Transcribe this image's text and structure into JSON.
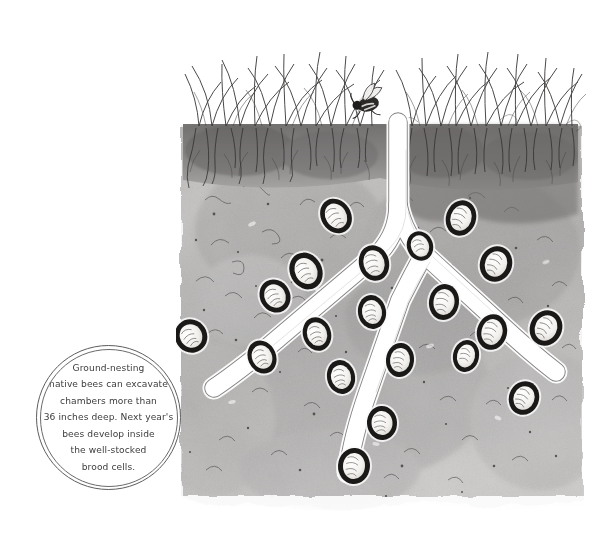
{
  "figure": {
    "caption": {
      "text": "Ground-nesting\nnative bees can excavate\nchambers more than\n36 inches deep. Next year's\nbees develop inside\nthe well-stocked\nbrood cells.",
      "lines": [
        "Ground-nesting",
        "native bees can excavate",
        "chambers more than",
        "36 inches deep. Next year's",
        "bees develop inside",
        "the well-stocked",
        "brood cells."
      ],
      "shape": "double-ring-circle",
      "text_color": "#3c3c3c",
      "ring_color": "#5d5d5d"
    },
    "style": {
      "medium": "pen-and-ink watercolor wash",
      "palette": {
        "background": "#ffffff",
        "soil_light": "#c9c7c6",
        "soil_mid": "#aeacab",
        "soil_dark": "#8d8b8a",
        "topsoil": "#7e7c7b",
        "ink": "#2b2b2b",
        "tunnel_fill": "#ffffff",
        "larva_fill": "#f7f6f4"
      }
    },
    "scene": {
      "soil_surface_y": 125,
      "soil_left": 181,
      "soil_right": 582,
      "soil_bottom": 510,
      "grass_patches": [
        {
          "name": "left-grass-patch",
          "x_start": 183,
          "x_end": 372,
          "blade_count": 26
        },
        {
          "name": "right-grass-patch",
          "x_start": 404,
          "x_end": 578,
          "blade_count": 24
        }
      ],
      "bee": {
        "name": "adult-bee",
        "x": 368,
        "y": 104,
        "note": "adult bee at nest entrance on soil surface"
      },
      "tunnels": [
        {
          "name": "main-shaft",
          "description": "vertical entrance shaft descending from surface"
        },
        {
          "name": "left-branch",
          "description": "branch running down-left toward lower left"
        },
        {
          "name": "right-branch",
          "description": "branch running down-right toward lower right"
        },
        {
          "name": "center-branch",
          "description": "branch descending to bottom center"
        }
      ],
      "brood_cell_count": 20,
      "brood_cells": [
        {
          "x": 336,
          "y": 216,
          "rx": 15,
          "ry": 18,
          "rot": -32
        },
        {
          "x": 461,
          "y": 218,
          "rx": 15,
          "ry": 18,
          "rot": 18
        },
        {
          "x": 306,
          "y": 271,
          "rx": 16,
          "ry": 19,
          "rot": -28
        },
        {
          "x": 374,
          "y": 263,
          "rx": 15,
          "ry": 18,
          "rot": -16
        },
        {
          "x": 496,
          "y": 264,
          "rx": 16,
          "ry": 18,
          "rot": 22
        },
        {
          "x": 275,
          "y": 296,
          "rx": 15,
          "ry": 17,
          "rot": -30
        },
        {
          "x": 372,
          "y": 312,
          "rx": 14,
          "ry": 17,
          "rot": -10
        },
        {
          "x": 444,
          "y": 302,
          "rx": 15,
          "ry": 18,
          "rot": 8
        },
        {
          "x": 546,
          "y": 328,
          "rx": 16,
          "ry": 18,
          "rot": 26
        },
        {
          "x": 191,
          "y": 336,
          "rx": 16,
          "ry": 17,
          "rot": -34
        },
        {
          "x": 317,
          "y": 334,
          "rx": 14,
          "ry": 17,
          "rot": -18
        },
        {
          "x": 492,
          "y": 332,
          "rx": 15,
          "ry": 18,
          "rot": 14
        },
        {
          "x": 262,
          "y": 357,
          "rx": 14,
          "ry": 17,
          "rot": -24
        },
        {
          "x": 400,
          "y": 360,
          "rx": 14,
          "ry": 17,
          "rot": 6
        },
        {
          "x": 341,
          "y": 377,
          "rx": 14,
          "ry": 17,
          "rot": -12
        },
        {
          "x": 524,
          "y": 398,
          "rx": 15,
          "ry": 17,
          "rot": 20
        },
        {
          "x": 382,
          "y": 423,
          "rx": 15,
          "ry": 17,
          "rot": -4
        },
        {
          "x": 354,
          "y": 466,
          "rx": 16,
          "ry": 18,
          "rot": 4
        },
        {
          "x": 420,
          "y": 246,
          "rx": 13,
          "ry": 15,
          "rot": -20
        },
        {
          "x": 466,
          "y": 356,
          "rx": 13,
          "ry": 16,
          "rot": 12
        }
      ]
    }
  }
}
